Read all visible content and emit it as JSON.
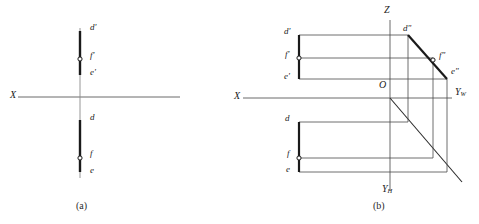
{
  "figure": {
    "title_a": "(a)",
    "title_b": "(b)"
  },
  "colors": {
    "thick_line": "#1a1a1a",
    "thin_line": "#4a4a4a",
    "axis_line": "#6b6b6b",
    "text": "#1a1a1a",
    "background": "#ffffff"
  },
  "diagram_a": {
    "caption": "(a)",
    "axes": [
      {
        "name": "x-axis",
        "label": "X",
        "x1": 18,
        "y1": 97,
        "x2": 180,
        "y2": 97
      },
      {
        "name": "vertical-axis",
        "label": "",
        "x1": 80,
        "y1": 28,
        "x2": 80,
        "y2": 178
      }
    ],
    "axis_labels": [
      {
        "name": "axis-label-x",
        "text": "X",
        "x": 12,
        "y": 91
      }
    ],
    "front_view": {
      "name": "front-view-projection",
      "segment": {
        "x1": 80,
        "y1": 31,
        "x2": 80,
        "y2": 75
      },
      "points": [
        {
          "id": "d-prime",
          "label": "d'",
          "x": 80,
          "y": 31,
          "lx": 90,
          "ly": 27,
          "marker": "none"
        },
        {
          "id": "f-prime",
          "label": "f'",
          "x": 80,
          "y": 59,
          "lx": 90,
          "ly": 55,
          "marker": "circle"
        },
        {
          "id": "e-prime",
          "label": "e'",
          "x": 80,
          "y": 75,
          "lx": 90,
          "ly": 72,
          "marker": "none"
        }
      ]
    },
    "top_view": {
      "name": "top-view-projection",
      "segment": {
        "x1": 80,
        "y1": 120,
        "x2": 80,
        "y2": 172
      },
      "points": [
        {
          "id": "d",
          "label": "d",
          "x": 80,
          "y": 120,
          "lx": 90,
          "ly": 117,
          "marker": "none"
        },
        {
          "id": "f",
          "label": "f",
          "x": 80,
          "y": 158,
          "lx": 90,
          "ly": 153,
          "marker": "circle"
        },
        {
          "id": "e",
          "label": "e",
          "x": 80,
          "y": 172,
          "lx": 90,
          "ly": 170,
          "marker": "none"
        }
      ]
    }
  },
  "diagram_b": {
    "caption": "(b)",
    "origin": {
      "name": "origin-point",
      "label": "O",
      "x": 390,
      "y": 98,
      "lx": 381,
      "ly": 84
    },
    "axes": [
      {
        "name": "z-axis",
        "label": "Z",
        "x1": 390,
        "y1": 20,
        "x2": 390,
        "y2": 190,
        "lx": 387,
        "ly": 9
      },
      {
        "name": "x-axis",
        "label": "X",
        "x1": 243,
        "y1": 98,
        "x2": 452,
        "y2": 98,
        "lx": 236,
        "ly": 92
      },
      {
        "name": "yw-axis",
        "label": "Yw",
        "base": "Y",
        "subscript": "W",
        "lx": 456,
        "ly": 93
      },
      {
        "name": "yh-axis",
        "label": "Yh",
        "base": "Y",
        "subscript": "H",
        "lx": 384,
        "ly": 189
      }
    ],
    "front_view": {
      "name": "front-view-projection",
      "segment": {
        "x1": 299,
        "y1": 35,
        "x2": 299,
        "y2": 79
      },
      "points": [
        {
          "id": "d-prime",
          "label": "d'",
          "x": 299,
          "y": 35,
          "lx": 285,
          "ly": 31,
          "marker": "none"
        },
        {
          "id": "f-prime",
          "label": "f'",
          "x": 299,
          "y": 58,
          "lx": 286,
          "ly": 54,
          "marker": "circle"
        },
        {
          "id": "e-prime",
          "label": "e'",
          "x": 299,
          "y": 79,
          "lx": 285,
          "ly": 76,
          "marker": "none"
        }
      ]
    },
    "side_view": {
      "name": "side-view-projection",
      "segment": {
        "x1": 408,
        "y1": 35,
        "x2": 447,
        "y2": 79
      },
      "points": [
        {
          "id": "d-double-prime",
          "label": "d\"",
          "x": 408,
          "y": 35,
          "lx": 404,
          "ly": 27,
          "marker": "none"
        },
        {
          "id": "f-double-prime",
          "label": "f\"",
          "x": 433,
          "y": 62,
          "lx": 440,
          "ly": 55,
          "marker": "circle"
        },
        {
          "id": "e-double-prime",
          "label": "e\"",
          "x": 447,
          "y": 79,
          "lx": 452,
          "ly": 71,
          "marker": "none"
        }
      ]
    },
    "top_view": {
      "name": "top-view-projection",
      "segment": {
        "x1": 299,
        "y1": 122,
        "x2": 299,
        "y2": 172
      },
      "points": [
        {
          "id": "d",
          "label": "d",
          "x": 299,
          "y": 122,
          "lx": 286,
          "ly": 118,
          "marker": "none"
        },
        {
          "id": "f",
          "label": "f",
          "x": 299,
          "y": 158,
          "lx": 288,
          "ly": 153,
          "marker": "circle"
        },
        {
          "id": "e",
          "label": "e",
          "x": 299,
          "y": 172,
          "lx": 287,
          "ly": 169,
          "marker": "none"
        }
      ]
    },
    "mitre_line": {
      "name": "45-degree-mitre-line",
      "x1": 390,
      "y1": 98,
      "x2": 462,
      "y2": 182
    },
    "projection_lines": [
      {
        "name": "proj-d-prime-to-d-double-prime",
        "x1": 299,
        "y1": 35,
        "x2": 408,
        "y2": 35
      },
      {
        "name": "proj-f-prime-to-f-double-prime",
        "x1": 299,
        "y1": 58,
        "x2": 433,
        "y2": 58
      },
      {
        "name": "proj-e-prime-to-e-double-prime",
        "x1": 299,
        "y1": 79,
        "x2": 447,
        "y2": 79
      },
      {
        "name": "proj-d-horizontal",
        "x1": 299,
        "y1": 122,
        "x2": 408,
        "y2": 122
      },
      {
        "name": "proj-f-horizontal",
        "x1": 299,
        "y1": 158,
        "x2": 433,
        "y2": 158
      },
      {
        "name": "proj-e-horizontal",
        "x1": 299,
        "y1": 172,
        "x2": 447,
        "y2": 172
      },
      {
        "name": "proj-d-vertical",
        "x1": 408,
        "y1": 35,
        "x2": 408,
        "y2": 122
      },
      {
        "name": "proj-f-vertical",
        "x1": 433,
        "y1": 58,
        "x2": 433,
        "y2": 158
      },
      {
        "name": "proj-e-vertical",
        "x1": 447,
        "y1": 79,
        "x2": 447,
        "y2": 172
      }
    ]
  }
}
